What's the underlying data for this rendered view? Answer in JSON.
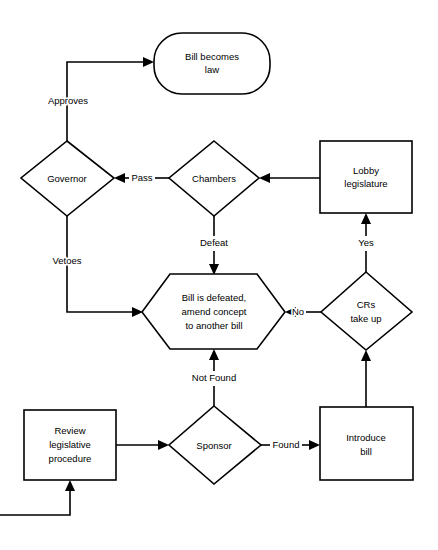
{
  "diagram": {
    "type": "flowchart",
    "background_color": "#ffffff",
    "line_color": "#000000",
    "nodes": [
      {
        "id": "bill-becomes-law",
        "shape": "rounded-rectangle",
        "label_line1": "Bill becomes",
        "label_line2": "law"
      },
      {
        "id": "governor",
        "shape": "diamond",
        "label_line1": "Governor",
        "label_line2": ""
      },
      {
        "id": "chambers",
        "shape": "diamond",
        "label_line1": "Chambers",
        "label_line2": ""
      },
      {
        "id": "lobby-legislature",
        "shape": "rectangle",
        "label_line1": "Lobby",
        "label_line2": "legislature"
      },
      {
        "id": "bill-is-defeated",
        "shape": "hexagon",
        "label_line1": "Bill is defeated,",
        "label_line2": "amend concept",
        "label_line3": "to another bill"
      },
      {
        "id": "crs-take-up",
        "shape": "diamond",
        "label_line1": "CRs",
        "label_line2": "take up"
      },
      {
        "id": "review-legislative-procedure",
        "shape": "rectangle",
        "label_line1": "Review",
        "label_line2": "legislative",
        "label_line3": "procedure"
      },
      {
        "id": "sponsor",
        "shape": "diamond",
        "label_line1": "Sponsor",
        "label_line2": ""
      },
      {
        "id": "introduce-bill",
        "shape": "rectangle",
        "label_line1": "Introduce",
        "label_line2": "bill"
      }
    ],
    "edges": [
      {
        "id": "governor-to-law",
        "from": "governor",
        "to": "bill-becomes-law",
        "label": "Approves"
      },
      {
        "id": "governor-to-defeated",
        "from": "governor",
        "to": "bill-is-defeated",
        "label": "Vetoes"
      },
      {
        "id": "chambers-to-governor",
        "from": "chambers",
        "to": "governor",
        "label": "Pass"
      },
      {
        "id": "chambers-to-defeated",
        "from": "chambers",
        "to": "bill-is-defeated",
        "label": "Defeat"
      },
      {
        "id": "lobby-to-chambers",
        "from": "lobby-legislature",
        "to": "chambers",
        "label": ""
      },
      {
        "id": "crs-to-lobby",
        "from": "crs-take-up",
        "to": "lobby-legislature",
        "label": "Yes"
      },
      {
        "id": "crs-to-defeated",
        "from": "crs-take-up",
        "to": "bill-is-defeated",
        "label": "No"
      },
      {
        "id": "introduce-to-crs",
        "from": "introduce-bill",
        "to": "crs-take-up",
        "label": ""
      },
      {
        "id": "review-to-sponsor",
        "from": "review-legislative-procedure",
        "to": "sponsor",
        "label": ""
      },
      {
        "id": "sponsor-to-introduce",
        "from": "sponsor",
        "to": "introduce-bill",
        "label": "Found"
      },
      {
        "id": "sponsor-to-defeated",
        "from": "sponsor",
        "to": "bill-is-defeated",
        "label": "Not Found"
      },
      {
        "id": "loop-to-review",
        "from": "offpage",
        "to": "review-legislative-procedure",
        "label": ""
      }
    ]
  }
}
